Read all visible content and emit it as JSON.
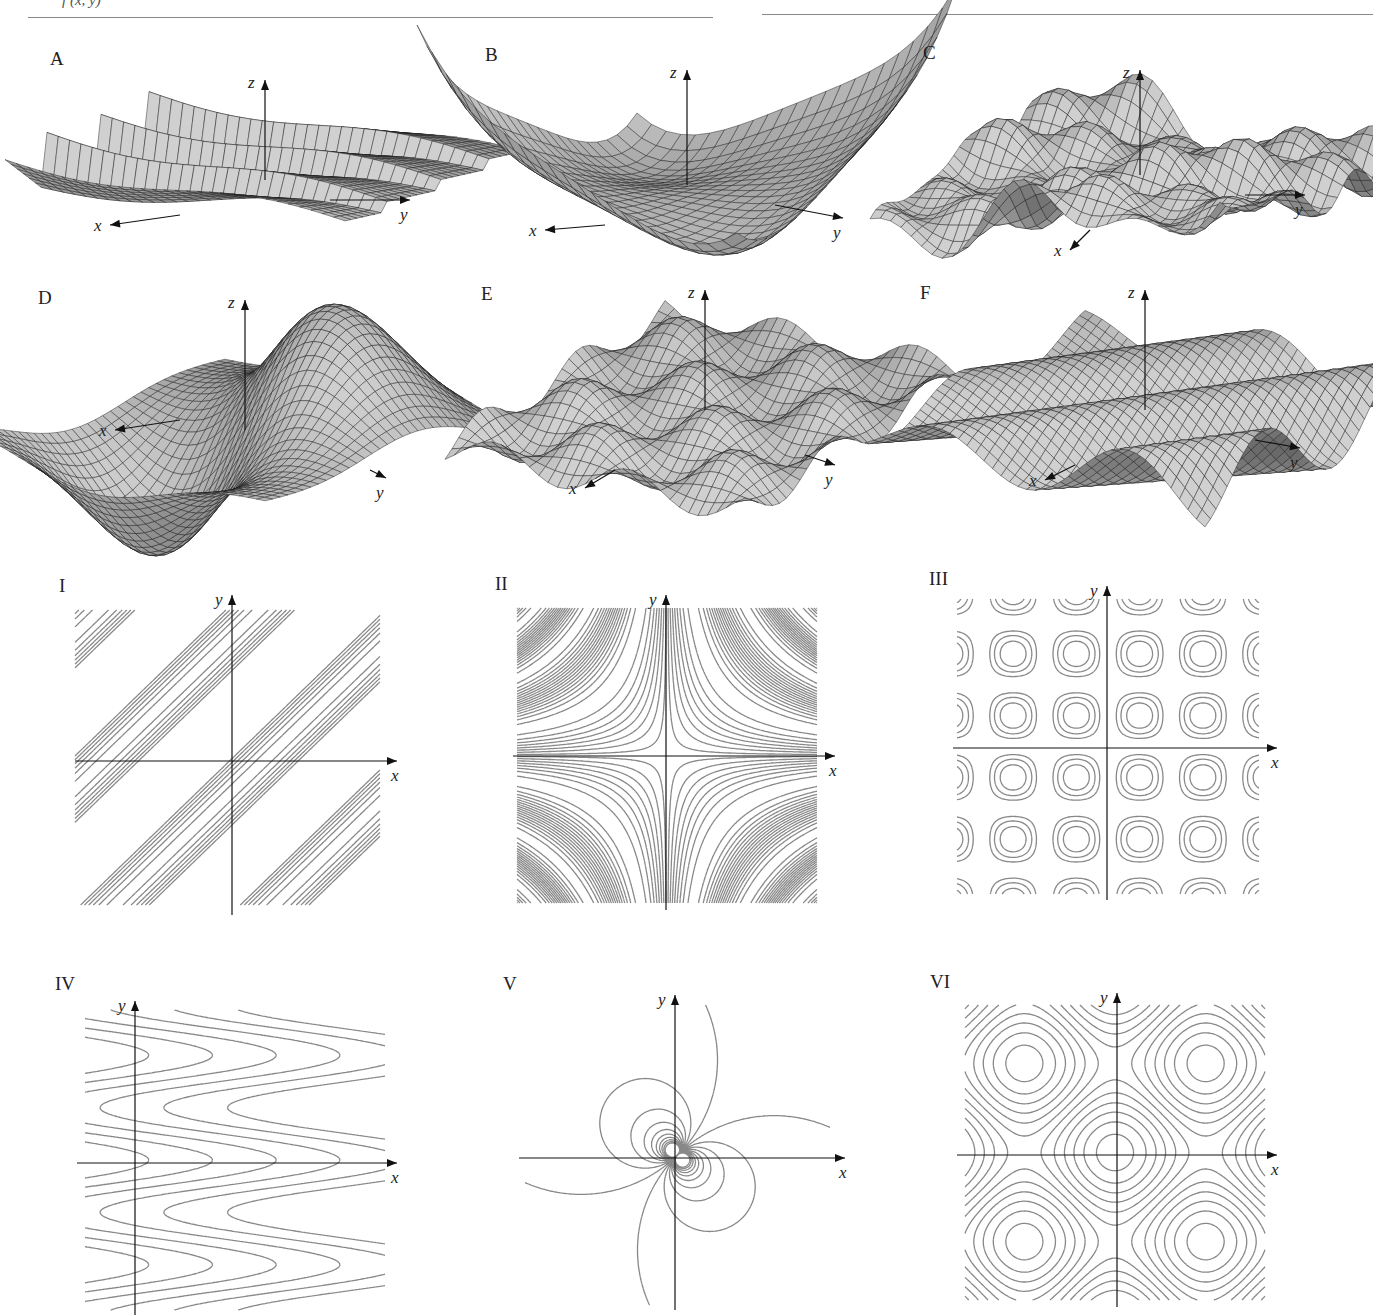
{
  "header": {
    "text": "f (x, y)",
    "rule_color": "#8a8a8a"
  },
  "colors": {
    "surface_light": "#c8c8c8",
    "surface_dark": "#5a5a5a",
    "mesh_line": "#1a1a1a",
    "contour_line": "#888888",
    "axis": "#111111"
  },
  "surfaces": [
    {
      "id": "A",
      "label": "A",
      "axes": {
        "x": "x",
        "y": "y",
        "z": "z"
      },
      "description": "sawtooth ridges decaying along y"
    },
    {
      "id": "B",
      "label": "B",
      "axes": {
        "x": "x",
        "y": "y",
        "z": "z"
      },
      "description": "saddle with raised corners"
    },
    {
      "id": "C",
      "label": "C",
      "axes": {
        "x": "x",
        "y": "y",
        "z": "z"
      },
      "description": "oscillating rough surface"
    },
    {
      "id": "D",
      "label": "D",
      "axes": {
        "x": "x",
        "y": "y",
        "z": "z"
      },
      "description": "dipole bump: peak and trough near origin"
    },
    {
      "id": "E",
      "label": "E",
      "axes": {
        "x": "x",
        "y": "y",
        "z": "z"
      },
      "description": "egg-crate sin(x)sin(y)"
    },
    {
      "id": "F",
      "label": "F",
      "axes": {
        "x": "x",
        "y": "y",
        "z": "z"
      },
      "description": "diagonal waves"
    }
  ],
  "contours": [
    {
      "id": "I",
      "label": "I",
      "axes": {
        "x": "x",
        "y": "y"
      },
      "description": "parallel diagonal bands"
    },
    {
      "id": "II",
      "label": "II",
      "axes": {
        "x": "x",
        "y": "y"
      },
      "description": "hyperbolas xy = c"
    },
    {
      "id": "III",
      "label": "III",
      "axes": {
        "x": "x",
        "y": "y"
      },
      "description": "checkerboard of closed loops"
    },
    {
      "id": "IV",
      "label": "IV",
      "axes": {
        "x": "x",
        "y": "y"
      },
      "description": "nested parabolic curves opening left"
    },
    {
      "id": "V",
      "label": "V",
      "axes": {
        "x": "x",
        "y": "y"
      },
      "description": "dipole: circles tangent at origin"
    },
    {
      "id": "VI",
      "label": "VI",
      "axes": {
        "x": "x",
        "y": "y"
      },
      "description": "central closed loop with saddles at corners"
    }
  ],
  "chart_data": [
    {
      "type": "surface",
      "title": "A",
      "xlabel": "x",
      "ylabel": "y",
      "zlabel": "z"
    },
    {
      "type": "surface",
      "title": "B",
      "xlabel": "x",
      "ylabel": "y",
      "zlabel": "z"
    },
    {
      "type": "surface",
      "title": "C",
      "xlabel": "x",
      "ylabel": "y",
      "zlabel": "z"
    },
    {
      "type": "surface",
      "title": "D",
      "xlabel": "x",
      "ylabel": "y",
      "zlabel": "z"
    },
    {
      "type": "surface",
      "title": "E",
      "xlabel": "x",
      "ylabel": "y",
      "zlabel": "z"
    },
    {
      "type": "surface",
      "title": "F",
      "xlabel": "x",
      "ylabel": "y",
      "zlabel": "z"
    },
    {
      "type": "contour",
      "title": "I",
      "xlabel": "x",
      "ylabel": "y"
    },
    {
      "type": "contour",
      "title": "II",
      "xlabel": "x",
      "ylabel": "y"
    },
    {
      "type": "contour",
      "title": "III",
      "xlabel": "x",
      "ylabel": "y"
    },
    {
      "type": "contour",
      "title": "IV",
      "xlabel": "x",
      "ylabel": "y"
    },
    {
      "type": "contour",
      "title": "V",
      "xlabel": "x",
      "ylabel": "y"
    },
    {
      "type": "contour",
      "title": "VI",
      "xlabel": "x",
      "ylabel": "y"
    }
  ]
}
